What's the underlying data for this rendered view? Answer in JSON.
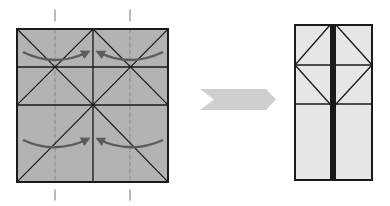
{
  "diagram": {
    "colors": {
      "paper_colored": "#b3b3b3",
      "paper_white": "#e6e6e6",
      "crease": "#1a1a1a",
      "valley_dash": "#8a8a8a",
      "curve_arrow": "#5c5c5c",
      "process_arrow": "#cfcfcf",
      "background": "#ffffff"
    },
    "before": {
      "label": "before-fold-square",
      "x": 17,
      "y": 29,
      "width": 151,
      "height": 153,
      "center_x": 93,
      "horizontal_creases_y": [
        67,
        105
      ],
      "valley_fold_lines_x": [
        55,
        130
      ],
      "valley_line_extent": {
        "top": 10,
        "bottom": 200
      },
      "curved_arrows": [
        {
          "name": "top-left-arrow",
          "from": [
            23,
            52
          ],
          "via": [
            55,
            62
          ],
          "to": [
            88,
            52
          ]
        },
        {
          "name": "top-right-arrow",
          "from": [
            163,
            52
          ],
          "via": [
            130,
            62
          ],
          "to": [
            98,
            52
          ]
        },
        {
          "name": "bottom-left-arrow",
          "from": [
            23,
            140
          ],
          "via": [
            55,
            149
          ],
          "to": [
            88,
            139
          ]
        },
        {
          "name": "bottom-right-arrow",
          "from": [
            163,
            140
          ],
          "via": [
            130,
            149
          ],
          "to": [
            98,
            139
          ]
        }
      ]
    },
    "process_arrow": {
      "label": "next-step-arrow",
      "left": 200,
      "notch": 214,
      "right": 276,
      "top": 89,
      "bottom": 110
    },
    "after": {
      "label": "after-fold-rectangle",
      "x": 295,
      "y": 25,
      "width": 77,
      "height": 155,
      "center_x": 333,
      "horizontal_creases_y": [
        65,
        104
      ]
    }
  }
}
